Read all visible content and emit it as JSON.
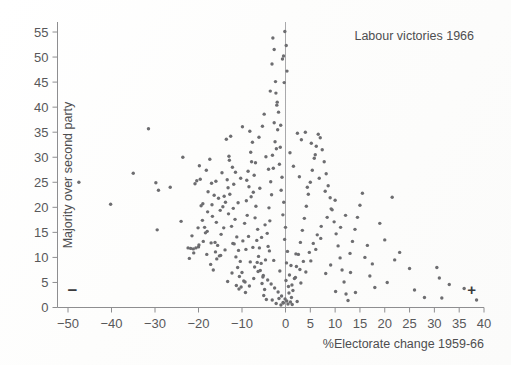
{
  "figure": {
    "title": "Labour victories 1966",
    "width": 511,
    "height": 365,
    "background": "#fefefe",
    "point_color": "#6d6d70",
    "axis_color": "#8e8e90",
    "text_color": "#58585a"
  },
  "annotations": {
    "negative_sign": "−",
    "positive_sign": "+"
  },
  "chart_data": {
    "type": "scatter",
    "title": "Labour victories 1966",
    "xlabel": "%Electorate change 1959-66",
    "ylabel": "Majority over second party",
    "xlim": [
      -52,
      41
    ],
    "ylim": [
      0,
      58
    ],
    "xticks": [
      -50,
      -40,
      -30,
      -20,
      -10,
      0,
      5,
      10,
      15,
      20,
      25,
      30,
      35,
      40
    ],
    "xtick_labels": [
      "−50",
      "−40",
      "−30",
      "−20",
      "−10",
      "0",
      "5",
      "10",
      "15",
      "20",
      "25",
      "30",
      "35",
      "40"
    ],
    "yticks": [
      0,
      5,
      10,
      15,
      20,
      25,
      30,
      35,
      40,
      45,
      50,
      55
    ],
    "ytick_labels": [
      "0",
      "5",
      "10",
      "15",
      "20",
      "25",
      "30",
      "35",
      "40",
      "45",
      "50",
      "55"
    ],
    "grid": false,
    "legend": null,
    "reference_lines": [
      {
        "orientation": "vertical",
        "value": 0,
        "color": "#a9a9ab"
      }
    ],
    "annotations": [
      {
        "text": "−",
        "x": -49,
        "y": 2.2,
        "bold": true
      },
      {
        "text": "+",
        "x": 37.5,
        "y": 2.4,
        "bold": true
      }
    ],
    "marker": "dot",
    "marker_size": 2,
    "n_points": 288,
    "points": [
      [
        -47.5,
        25.0
      ],
      [
        -40.2,
        20.6
      ],
      [
        -35.0,
        26.8
      ],
      [
        -31.5,
        35.7
      ],
      [
        -29.8,
        24.9
      ],
      [
        -29.2,
        23.4
      ],
      [
        -29.5,
        15.5
      ],
      [
        -26.5,
        24.0
      ],
      [
        -24.0,
        17.2
      ],
      [
        -23.6,
        30.0
      ],
      [
        -22.4,
        11.9
      ],
      [
        -21.8,
        11.8
      ],
      [
        -21.2,
        11.7
      ],
      [
        -20.6,
        11.9
      ],
      [
        -20.0,
        12.1
      ],
      [
        -20.4,
        25.3
      ],
      [
        -20.8,
        24.7
      ],
      [
        -19.6,
        25.6
      ],
      [
        -19.0,
        20.7
      ],
      [
        -19.4,
        20.3
      ],
      [
        -18.6,
        16.0
      ],
      [
        -18.0,
        15.2
      ],
      [
        -18.4,
        14.9
      ],
      [
        -19.8,
        28.3
      ],
      [
        -18.2,
        27.4
      ],
      [
        -17.4,
        29.6
      ],
      [
        -17.0,
        24.8
      ],
      [
        -17.8,
        23.1
      ],
      [
        -16.4,
        22.4
      ],
      [
        -16.0,
        25.2
      ],
      [
        -16.8,
        18.2
      ],
      [
        -16.2,
        13.0
      ],
      [
        -15.6,
        12.4
      ],
      [
        -17.2,
        8.6
      ],
      [
        -16.6,
        7.5
      ],
      [
        -15.2,
        10.3
      ],
      [
        -15.8,
        9.7
      ],
      [
        -14.8,
        14.6
      ],
      [
        -14.2,
        15.9
      ],
      [
        -15.0,
        19.4
      ],
      [
        -14.4,
        20.1
      ],
      [
        -13.8,
        21.0
      ],
      [
        -14.6,
        26.9
      ],
      [
        -13.4,
        25.5
      ],
      [
        -13.0,
        30.2
      ],
      [
        -12.6,
        34.2
      ],
      [
        -13.6,
        33.6
      ],
      [
        -12.2,
        28.0
      ],
      [
        -12.8,
        22.6
      ],
      [
        -12.0,
        19.8
      ],
      [
        -11.6,
        17.6
      ],
      [
        -12.4,
        16.2
      ],
      [
        -11.2,
        14.1
      ],
      [
        -11.8,
        12.7
      ],
      [
        -10.8,
        11.4
      ],
      [
        -11.4,
        10.1
      ],
      [
        -10.4,
        9.2
      ],
      [
        -11.0,
        8.0
      ],
      [
        -10.0,
        7.0
      ],
      [
        -10.6,
        6.2
      ],
      [
        -9.6,
        5.3
      ],
      [
        -10.2,
        4.1
      ],
      [
        -9.2,
        3.0
      ],
      [
        -9.8,
        13.3
      ],
      [
        -9.4,
        16.8
      ],
      [
        -8.8,
        18.4
      ],
      [
        -9.0,
        21.3
      ],
      [
        -8.4,
        24.1
      ],
      [
        -8.6,
        27.2
      ],
      [
        -8.0,
        31.0
      ],
      [
        -8.2,
        35.2
      ],
      [
        -7.6,
        33.0
      ],
      [
        -7.8,
        29.1
      ],
      [
        -7.2,
        26.4
      ],
      [
        -7.4,
        23.0
      ],
      [
        -6.8,
        20.2
      ],
      [
        -7.0,
        17.9
      ],
      [
        -6.4,
        15.6
      ],
      [
        -6.6,
        13.4
      ],
      [
        -6.0,
        11.9
      ],
      [
        -6.2,
        10.2
      ],
      [
        -5.6,
        8.8
      ],
      [
        -5.8,
        7.4
      ],
      [
        -5.2,
        6.1
      ],
      [
        -5.4,
        4.8
      ],
      [
        -4.8,
        3.6
      ],
      [
        -5.0,
        2.4
      ],
      [
        -4.4,
        1.6
      ],
      [
        -4.6,
        9.5
      ],
      [
        -4.0,
        12.2
      ],
      [
        -4.2,
        14.8
      ],
      [
        -3.6,
        17.3
      ],
      [
        -3.8,
        19.9
      ],
      [
        -3.2,
        22.5
      ],
      [
        -3.4,
        25.1
      ],
      [
        -2.8,
        27.8
      ],
      [
        -3.0,
        30.4
      ],
      [
        -2.4,
        33.1
      ],
      [
        -2.6,
        36.9
      ],
      [
        -2.0,
        40.4
      ],
      [
        -2.2,
        42.8
      ],
      [
        -1.6,
        39.0
      ],
      [
        -1.8,
        35.5
      ],
      [
        -1.2,
        32.0
      ],
      [
        -1.4,
        28.6
      ],
      [
        -0.8,
        26.0
      ],
      [
        -1.0,
        23.4
      ],
      [
        -0.4,
        21.0
      ],
      [
        -0.6,
        18.5
      ],
      [
        0.0,
        16.0
      ],
      [
        -0.2,
        13.6
      ],
      [
        0.4,
        11.2
      ],
      [
        0.2,
        8.9
      ],
      [
        0.8,
        6.5
      ],
      [
        0.6,
        4.2
      ],
      [
        1.2,
        2.0
      ],
      [
        1.0,
        1.1
      ],
      [
        -0.5,
        0.9
      ],
      [
        0.5,
        0.7
      ],
      [
        -1.5,
        1.8
      ],
      [
        1.5,
        3.4
      ],
      [
        1.8,
        5.8
      ],
      [
        2.2,
        8.2
      ],
      [
        2.6,
        10.6
      ],
      [
        3.0,
        13.0
      ],
      [
        3.4,
        15.4
      ],
      [
        3.8,
        17.8
      ],
      [
        4.2,
        20.2
      ],
      [
        4.6,
        22.6
      ],
      [
        5.0,
        25.0
      ],
      [
        5.4,
        27.4
      ],
      [
        5.8,
        29.8
      ],
      [
        6.2,
        32.2
      ],
      [
        6.6,
        34.6
      ],
      [
        7.0,
        33.9
      ],
      [
        7.4,
        31.5
      ],
      [
        7.8,
        29.1
      ],
      [
        8.2,
        26.7
      ],
      [
        8.6,
        24.3
      ],
      [
        9.0,
        21.9
      ],
      [
        9.4,
        19.5
      ],
      [
        9.8,
        17.1
      ],
      [
        10.2,
        14.7
      ],
      [
        10.6,
        12.3
      ],
      [
        11.0,
        9.9
      ],
      [
        11.4,
        7.5
      ],
      [
        11.8,
        5.1
      ],
      [
        12.2,
        2.7
      ],
      [
        12.6,
        1.4
      ],
      [
        13.0,
        10.8
      ],
      [
        13.5,
        13.2
      ],
      [
        14.0,
        15.6
      ],
      [
        14.5,
        18.0
      ],
      [
        15.0,
        20.4
      ],
      [
        15.5,
        22.8
      ],
      [
        16.0,
        10.0
      ],
      [
        16.5,
        12.4
      ],
      [
        17.0,
        6.3
      ],
      [
        17.5,
        8.7
      ],
      [
        18.0,
        4.0
      ],
      [
        19.0,
        16.8
      ],
      [
        20.0,
        13.5
      ],
      [
        20.5,
        5.0
      ],
      [
        21.5,
        22.0
      ],
      [
        22.0,
        9.5
      ],
      [
        23.0,
        11.0
      ],
      [
        25.0,
        7.8
      ],
      [
        26.0,
        3.5
      ],
      [
        28.0,
        2.0
      ],
      [
        30.5,
        8.0
      ],
      [
        31.0,
        5.9
      ],
      [
        31.5,
        1.9
      ],
      [
        33.0,
        4.6
      ],
      [
        36.0,
        3.8
      ],
      [
        38.5,
        1.5
      ],
      [
        -2.9,
        53.8
      ],
      [
        -2.6,
        51.5
      ],
      [
        -3.1,
        48.6
      ],
      [
        -2.3,
        45.1
      ],
      [
        -3.5,
        43.2
      ],
      [
        -1.9,
        41.0
      ],
      [
        -4.9,
        38.6
      ],
      [
        -5.3,
        36.2
      ],
      [
        -6.1,
        34.0
      ],
      [
        -9.9,
        36.1
      ],
      [
        2.4,
        34.8
      ],
      [
        3.2,
        33.5
      ],
      [
        4.0,
        35.0
      ],
      [
        5.2,
        32.8
      ],
      [
        6.0,
        30.5
      ],
      [
        1.6,
        28.2
      ],
      [
        2.8,
        26.1
      ],
      [
        4.4,
        24.0
      ],
      [
        6.8,
        25.8
      ],
      [
        8.0,
        23.2
      ],
      [
        -12.9,
        29.4
      ],
      [
        -11.5,
        27.0
      ],
      [
        -10.3,
        25.8
      ],
      [
        -13.2,
        23.9
      ],
      [
        -15.4,
        21.8
      ],
      [
        -16.9,
        20.5
      ],
      [
        -17.9,
        19.1
      ],
      [
        -19.1,
        17.4
      ],
      [
        -20.1,
        15.9
      ],
      [
        -21.5,
        14.3
      ],
      [
        -12.1,
        12.8
      ],
      [
        -13.9,
        11.5
      ],
      [
        -14.9,
        10.4
      ],
      [
        -8.1,
        9.1
      ],
      [
        -7.1,
        8.1
      ],
      [
        -6.3,
        7.2
      ],
      [
        -5.1,
        6.4
      ],
      [
        -4.1,
        5.5
      ],
      [
        -3.3,
        4.7
      ],
      [
        -2.5,
        3.9
      ],
      [
        -1.7,
        3.1
      ],
      [
        -0.9,
        2.3
      ],
      [
        -0.1,
        1.7
      ],
      [
        0.7,
        2.9
      ],
      [
        1.3,
        4.5
      ],
      [
        2.0,
        6.0
      ],
      [
        2.9,
        7.6
      ],
      [
        3.6,
        9.2
      ],
      [
        4.8,
        11.0
      ],
      [
        5.6,
        12.8
      ],
      [
        6.4,
        14.5
      ],
      [
        7.2,
        16.2
      ],
      [
        8.4,
        18.0
      ],
      [
        9.2,
        19.7
      ],
      [
        10.0,
        21.4
      ],
      [
        -0.3,
        44.9
      ],
      [
        0.3,
        47.2
      ],
      [
        -0.7,
        49.6
      ],
      [
        0.9,
        30.9
      ],
      [
        -1.1,
        36.4
      ],
      [
        -2.1,
        31.7
      ],
      [
        -3.9,
        27.6
      ],
      [
        -4.5,
        30.1
      ],
      [
        -5.9,
        23.8
      ],
      [
        -6.9,
        28.9
      ],
      [
        -7.9,
        22.1
      ],
      [
        -8.9,
        25.4
      ],
      [
        -10.9,
        20.9
      ],
      [
        -11.9,
        24.6
      ],
      [
        -13.1,
        18.7
      ],
      [
        -14.1,
        22.2
      ],
      [
        -15.9,
        17.0
      ],
      [
        -18.9,
        13.2
      ],
      [
        -19.9,
        12.5
      ],
      [
        -21.1,
        10.9
      ],
      [
        -22.1,
        9.8
      ],
      [
        -9.1,
        11.6
      ],
      [
        -8.5,
        14.2
      ],
      [
        -7.5,
        12.0
      ],
      [
        -6.5,
        9.0
      ],
      [
        -5.5,
        14.0
      ],
      [
        -4.7,
        16.5
      ],
      [
        -3.7,
        11.3
      ],
      [
        -2.7,
        9.4
      ],
      [
        -1.3,
        7.3
      ],
      [
        0.1,
        5.4
      ],
      [
        1.1,
        8.4
      ],
      [
        2.1,
        10.7
      ],
      [
        3.1,
        4.9
      ],
      [
        4.1,
        7.1
      ],
      [
        5.1,
        9.3
      ],
      [
        6.1,
        11.6
      ],
      [
        7.1,
        13.8
      ],
      [
        8.1,
        6.8
      ],
      [
        9.1,
        8.5
      ],
      [
        10.1,
        3.2
      ],
      [
        11.1,
        16.0
      ],
      [
        12.1,
        18.4
      ],
      [
        13.1,
        7.0
      ],
      [
        14.1,
        3.0
      ],
      [
        -0.15,
        55.1
      ],
      [
        0.15,
        52.3
      ],
      [
        -0.45,
        50.2
      ],
      [
        -1.05,
        0.5
      ],
      [
        1.35,
        0.6
      ],
      [
        -2.15,
        0.8
      ],
      [
        0.25,
        1.3
      ],
      [
        -0.55,
        1.0
      ],
      [
        2.35,
        1.2
      ],
      [
        -3.05,
        1.5
      ],
      [
        -8.3,
        4.3
      ],
      [
        -9.3,
        5.1
      ],
      [
        -10.7,
        3.7
      ],
      [
        -12.3,
        6.9
      ],
      [
        -13.3,
        5.2
      ],
      [
        -11.3,
        4.4
      ],
      [
        -7.3,
        5.8
      ],
      [
        -16.1,
        11.1
      ],
      [
        -17.1,
        12.9
      ],
      [
        -18.1,
        10.6
      ]
    ]
  }
}
